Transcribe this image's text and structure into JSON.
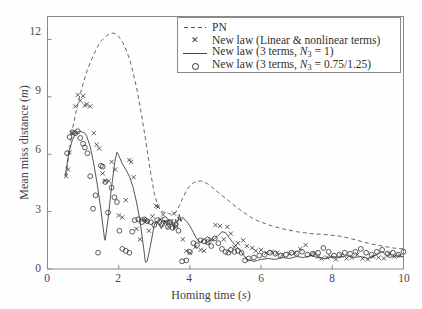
{
  "figure": {
    "background_color": "#fefefe",
    "frame_color": "#8a8a8a"
  },
  "axes": {
    "x_label": "Homing time (",
    "x_label_unit": "s",
    "x_label_close": ")",
    "y_label": "Mean miss distance (",
    "y_label_unit": "m",
    "y_label_close": ")",
    "x_ticks": [
      "0",
      "2",
      "4",
      "6",
      "8",
      "10"
    ],
    "y_ticks": [
      "0",
      "3",
      "6",
      "9",
      "12"
    ]
  },
  "legend": {
    "items": [
      {
        "key": "dashed-line",
        "label": "PN"
      },
      {
        "key": "x-marker",
        "label": "New law (Linear & nonlinear terms)"
      },
      {
        "key": "solid-line",
        "label": "New law (3 terms, "
      },
      {
        "key": "circle-marker",
        "label": "New law (3 terms, "
      }
    ],
    "solid_symbol": "N",
    "solid_sub": "3",
    "solid_value": " = 1)",
    "circle_symbol": "N",
    "circle_sub": "3",
    "circle_value": " = 0.75/1.25)"
  },
  "chart_data": {
    "type": "line",
    "title": "",
    "xlabel": "Homing time (s)",
    "ylabel": "Mean miss distance (m)",
    "xlim": [
      0,
      10
    ],
    "ylim": [
      0,
      13.2
    ],
    "grid": false,
    "legend_position": "top-right",
    "series": [
      {
        "name": "PN",
        "style": "dashed",
        "color": "#555555",
        "x": [
          0.52,
          0.6,
          0.7,
          0.8,
          0.9,
          1.0,
          1.1,
          1.2,
          1.3,
          1.4,
          1.5,
          1.6,
          1.7,
          1.8,
          1.85,
          1.9,
          2.0,
          2.1,
          2.2,
          2.3,
          2.4,
          2.5,
          2.6,
          2.7,
          2.8,
          2.9,
          3.0,
          3.1,
          3.2,
          3.3,
          3.4,
          3.5,
          3.6,
          3.7,
          3.8,
          3.9,
          4.0,
          4.1,
          4.2,
          4.3,
          4.4,
          4.5,
          4.6,
          4.8,
          5.0,
          5.2,
          5.4,
          5.6,
          5.8,
          6.0,
          6.3,
          6.6,
          7.0,
          7.4,
          7.8,
          8.2,
          8.5,
          8.8,
          9.1,
          9.4,
          9.7,
          10.0
        ],
        "y": [
          4.85,
          6.0,
          7.3,
          8.2,
          9.0,
          9.7,
          10.3,
          10.8,
          11.2,
          11.6,
          11.9,
          12.1,
          12.25,
          12.32,
          12.33,
          12.3,
          12.15,
          11.9,
          11.5,
          11.0,
          10.3,
          9.5,
          8.5,
          7.4,
          6.2,
          5.0,
          3.95,
          3.3,
          3.0,
          2.95,
          2.9,
          2.85,
          2.95,
          3.3,
          3.7,
          4.1,
          4.35,
          4.5,
          4.58,
          4.6,
          4.55,
          4.45,
          4.3,
          4.0,
          3.7,
          3.4,
          3.1,
          2.85,
          2.6,
          2.45,
          2.25,
          2.1,
          1.95,
          1.85,
          1.8,
          1.72,
          1.6,
          1.45,
          1.3,
          1.2,
          1.1,
          1.05
        ]
      },
      {
        "name": "New law (3 terms, N3 = 1)",
        "style": "solid",
        "color": "#444444",
        "x": [
          0.5,
          0.6,
          0.7,
          0.8,
          0.9,
          1.0,
          1.05,
          1.1,
          1.2,
          1.3,
          1.4,
          1.5,
          1.6,
          1.62,
          1.7,
          1.8,
          1.9,
          1.95,
          2.0,
          2.1,
          2.2,
          2.3,
          2.4,
          2.5,
          2.6,
          2.7,
          2.75,
          2.8,
          2.9,
          3.0,
          3.05,
          3.1,
          3.2,
          3.25,
          3.3,
          3.35,
          3.4,
          3.45,
          3.5,
          3.55,
          3.6,
          3.65,
          3.7,
          3.75,
          3.8,
          3.9,
          4.0,
          4.1,
          4.2,
          4.3,
          4.4,
          4.5,
          4.6,
          4.7,
          4.8,
          4.9,
          5.0,
          5.1,
          5.2,
          5.3,
          5.4,
          5.5,
          5.6,
          5.7,
          5.8,
          5.9,
          6.0,
          6.2,
          6.4,
          6.6,
          6.8,
          7.0,
          7.2,
          7.4,
          7.6,
          7.8,
          8.0,
          8.2,
          8.4,
          8.6,
          8.8,
          9.0,
          9.2,
          9.4,
          9.5,
          9.6,
          9.8,
          10.0
        ],
        "y": [
          4.9,
          6.1,
          6.75,
          7.1,
          7.2,
          7.15,
          7.1,
          6.95,
          6.4,
          5.5,
          4.4,
          3.1,
          1.6,
          1.5,
          2.6,
          4.3,
          5.7,
          6.1,
          5.95,
          5.5,
          5.2,
          4.85,
          4.3,
          3.5,
          2.5,
          1.1,
          0.35,
          0.4,
          1.3,
          2.3,
          2.5,
          2.4,
          2.1,
          2.35,
          2.55,
          2.3,
          2.6,
          2.3,
          2.45,
          2.05,
          2.6,
          2.4,
          2.85,
          2.5,
          2.7,
          2.5,
          2.25,
          1.9,
          1.55,
          1.4,
          1.55,
          1.7,
          1.45,
          1.6,
          1.75,
          1.95,
          1.9,
          1.65,
          1.4,
          1.2,
          1.0,
          0.75,
          0.5,
          0.45,
          0.4,
          0.45,
          0.5,
          0.55,
          0.5,
          0.6,
          0.55,
          0.65,
          0.6,
          0.7,
          0.6,
          0.55,
          0.65,
          0.6,
          0.7,
          0.6,
          0.65,
          0.55,
          0.7,
          0.9,
          0.75,
          0.6,
          0.7,
          0.65
        ]
      },
      {
        "name": "New law (Linear & nonlinear terms)",
        "style": "markers",
        "marker": "x",
        "color": "#333333",
        "x": [
          0.52,
          0.58,
          0.62,
          0.7,
          0.78,
          0.85,
          0.92,
          1.0,
          1.05,
          1.1,
          1.2,
          1.3,
          1.38,
          1.45,
          1.55,
          1.62,
          1.72,
          1.8,
          1.9,
          2.0,
          2.1,
          2.2,
          2.3,
          2.35,
          2.42,
          2.5,
          2.6,
          2.7,
          2.78,
          2.85,
          2.95,
          3.05,
          3.1,
          3.18,
          3.25,
          3.32,
          3.4,
          3.48,
          3.55,
          3.62,
          3.7,
          3.8,
          3.9,
          4.0,
          4.15,
          4.3,
          4.4,
          4.5,
          4.6,
          4.72,
          4.85,
          4.95,
          5.05,
          5.15,
          5.25,
          5.35,
          5.5,
          5.6,
          5.75,
          5.85,
          6.0,
          6.15,
          6.3,
          6.45,
          6.6,
          6.8,
          6.95,
          7.1,
          7.25,
          7.4,
          7.5,
          7.6,
          7.7,
          7.85,
          7.95,
          8.1,
          8.25,
          8.4,
          8.55,
          8.7,
          8.85,
          9.0,
          9.15,
          9.3,
          9.45,
          9.6,
          9.75,
          9.9
        ],
        "y": [
          4.85,
          5.2,
          6.1,
          7.1,
          8.5,
          9.1,
          8.8,
          9.05,
          8.55,
          8.6,
          8.5,
          7.1,
          6.5,
          6.3,
          5.0,
          4.6,
          4.6,
          5.6,
          5.2,
          2.8,
          2.7,
          3.6,
          5.7,
          5.6,
          4.8,
          2.1,
          1.55,
          2.6,
          2.5,
          2.0,
          2.75,
          3.3,
          3.25,
          2.6,
          2.85,
          2.45,
          2.2,
          2.5,
          2.9,
          2.25,
          2.6,
          1.55,
          0.95,
          0.85,
          1.15,
          1.0,
          0.95,
          1.4,
          1.55,
          2.3,
          2.25,
          1.55,
          2.2,
          1.85,
          1.15,
          1.35,
          1.5,
          1.2,
          1.1,
          0.95,
          1.0,
          0.85,
          0.9,
          0.85,
          0.75,
          0.8,
          0.85,
          1.05,
          1.25,
          0.75,
          0.8,
          0.65,
          0.55,
          0.6,
          0.65,
          0.5,
          0.7,
          0.55,
          0.6,
          0.75,
          0.55,
          0.5,
          0.65,
          0.6,
          0.55,
          0.8,
          0.65,
          0.7
        ]
      },
      {
        "name": "New law (3 terms, N3 = 0.75/1.25)",
        "style": "markers",
        "marker": "o",
        "color": "#333333",
        "x": [
          0.55,
          0.62,
          0.7,
          0.78,
          0.85,
          0.92,
          1.0,
          1.05,
          1.12,
          1.2,
          1.28,
          1.35,
          1.42,
          1.5,
          1.55,
          1.62,
          1.7,
          1.8,
          1.88,
          1.95,
          2.02,
          2.1,
          2.2,
          2.3,
          2.38,
          2.45,
          2.55,
          2.65,
          2.72,
          2.8,
          2.9,
          3.0,
          3.08,
          3.15,
          3.22,
          3.3,
          3.38,
          3.45,
          3.52,
          3.6,
          3.68,
          3.78,
          3.9,
          4.0,
          4.1,
          4.2,
          4.3,
          4.4,
          4.5,
          4.6,
          4.7,
          4.8,
          4.9,
          5.0,
          5.08,
          5.15,
          5.25,
          5.35,
          5.45,
          5.55,
          5.65,
          5.8,
          5.95,
          6.1,
          6.25,
          6.4,
          6.55,
          6.7,
          6.85,
          7.0,
          7.15,
          7.3,
          7.45,
          7.6,
          7.75,
          7.9,
          8.05,
          8.2,
          8.35,
          8.5,
          8.65,
          8.8,
          8.95,
          9.1,
          9.25,
          9.4,
          9.55,
          9.7,
          9.85,
          10.0
        ],
        "y": [
          6.05,
          6.9,
          7.15,
          7.1,
          7.2,
          6.85,
          6.55,
          6.35,
          6.05,
          4.85,
          3.15,
          3.85,
          0.85,
          5.4,
          5.35,
          4.55,
          2.95,
          4.25,
          3.75,
          3.5,
          2.0,
          1.05,
          0.95,
          0.85,
          1.95,
          2.55,
          2.6,
          2.45,
          2.6,
          2.5,
          2.45,
          2.3,
          2.55,
          2.45,
          2.35,
          2.6,
          2.2,
          2.45,
          2.15,
          2.3,
          2.0,
          0.4,
          0.45,
          0.9,
          1.35,
          1.25,
          1.5,
          1.45,
          1.4,
          1.2,
          1.6,
          1.35,
          1.05,
          0.9,
          0.85,
          1.0,
          0.9,
          0.95,
          0.85,
          0.45,
          0.55,
          0.6,
          0.7,
          0.75,
          0.85,
          0.8,
          0.7,
          0.75,
          0.85,
          0.8,
          0.9,
          0.75,
          0.8,
          0.85,
          1.1,
          0.9,
          0.7,
          0.75,
          0.85,
          0.8,
          0.9,
          1.05,
          0.85,
          0.75,
          0.9,
          1.0,
          0.8,
          0.85,
          0.75,
          0.9
        ]
      }
    ]
  }
}
